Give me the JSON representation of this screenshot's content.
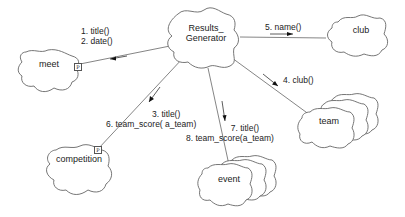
{
  "diagram": {
    "type": "object-collaboration-diagram",
    "objects": {
      "results_generator": {
        "label_line1": "Results_",
        "label_line2": "Generator"
      },
      "meet": {
        "label": "meet",
        "adornment": "P"
      },
      "club": {
        "label": "club"
      },
      "competition": {
        "label": "competition",
        "adornment": "P"
      },
      "event": {
        "label": "event",
        "multiple": true
      },
      "team": {
        "label": "team",
        "multiple": true
      }
    },
    "messages": {
      "to_meet": {
        "line1": "1.  title()",
        "line2": "2.  date()"
      },
      "to_club": {
        "line1": "5. name()"
      },
      "to_team": {
        "line1": "4. club()"
      },
      "to_competition": {
        "line1": "3. title()",
        "line2": "6. team_score( a_team)"
      },
      "to_event": {
        "line1": "7. title()",
        "line2": "8. team_score(a_team)"
      }
    }
  }
}
